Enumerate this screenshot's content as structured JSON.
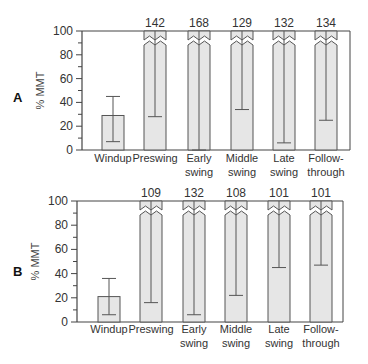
{
  "chart_data": [
    {
      "panel": "A",
      "type": "bar",
      "ylabel": "% MMT",
      "ylim": [
        0,
        100
      ],
      "yticks": [
        0,
        20,
        40,
        60,
        80,
        100
      ],
      "categories": [
        "Windup",
        "Preswing",
        "Early swing",
        "Middle swing",
        "Late swing",
        "Follow-through"
      ],
      "category_lines": [
        [
          "Windup"
        ],
        [
          "Preswing"
        ],
        [
          "Early",
          "swing"
        ],
        [
          "Middle",
          "swing"
        ],
        [
          "Late",
          "swing"
        ],
        [
          "Follow-",
          "through"
        ]
      ],
      "values": [
        29,
        142,
        168,
        129,
        132,
        134
      ],
      "value_labels": [
        "",
        "142",
        "168",
        "129",
        "132",
        "134"
      ],
      "error_low": [
        7,
        28,
        0,
        34,
        6,
        25
      ],
      "error_high": [
        45,
        256,
        336,
        224,
        258,
        243
      ],
      "broken_axis_bars": [
        false,
        true,
        true,
        true,
        true,
        true
      ]
    },
    {
      "panel": "B",
      "type": "bar",
      "ylabel": "% MMT",
      "ylim": [
        0,
        100
      ],
      "yticks": [
        0,
        20,
        40,
        60,
        80,
        100
      ],
      "categories": [
        "Windup",
        "Preswing",
        "Early swing",
        "Middle swing",
        "Late swing",
        "Follow-through"
      ],
      "category_lines": [
        [
          "Windup"
        ],
        [
          "Preswing"
        ],
        [
          "Early",
          "swing"
        ],
        [
          "Middle",
          "swing"
        ],
        [
          "Late",
          "swing"
        ],
        [
          "Follow-",
          "through"
        ]
      ],
      "values": [
        21,
        109,
        132,
        108,
        101,
        101
      ],
      "value_labels": [
        "",
        "109",
        "132",
        "108",
        "101",
        "101"
      ],
      "error_low": [
        6,
        16,
        6,
        22,
        45,
        47
      ],
      "error_high": [
        36,
        202,
        258,
        194,
        157,
        155
      ],
      "broken_axis_bars": [
        false,
        true,
        true,
        true,
        true,
        true
      ]
    }
  ],
  "colors": {
    "bar_fill": "#e6e6e6",
    "bar_stroke": "#555555",
    "axis": "#444444"
  }
}
